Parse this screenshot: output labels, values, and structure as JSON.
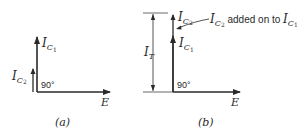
{
  "diagram_a": {
    "caption": "(a)",
    "vector_ic1": {
      "main": "I",
      "sub": "C",
      "subsub": "1"
    },
    "vector_ic2": {
      "main": "I",
      "sub": "C",
      "subsub": "2"
    },
    "vector_e": "E",
    "angle": "90°"
  },
  "diagram_b": {
    "caption": "(b)",
    "vector_ic1": {
      "main": "I",
      "sub": "C",
      "subsub": "1"
    },
    "vector_ic2": {
      "main": "I",
      "sub": "C",
      "subsub": "2"
    },
    "vector_e": "E",
    "angle": "90°",
    "total": {
      "main": "I",
      "sub": "T"
    },
    "annotation": {
      "lead": {
        "main": "I",
        "sub": "C",
        "subsub": "2"
      },
      "text": " added on to ",
      "trail": {
        "main": "I",
        "sub": "C",
        "subsub": "1"
      }
    }
  },
  "colors": {
    "ink": "#2a2a2a",
    "background": "#ffffff"
  }
}
